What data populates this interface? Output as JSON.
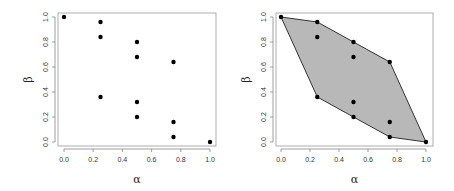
{
  "chart_data": [
    {
      "type": "scatter",
      "title": "",
      "xlabel": "α",
      "ylabel": "β",
      "xlim": [
        0,
        1
      ],
      "ylim": [
        0,
        1
      ],
      "xticks": [
        "0.0",
        "0.2",
        "0.4",
        "0.6",
        "0.8",
        "1.0"
      ],
      "yticks": [
        "0.0",
        "0.2",
        "0.4",
        "0.6",
        "0.8",
        "1.0"
      ],
      "grid": false,
      "legend": null,
      "points": [
        {
          "x": 0.0,
          "y": 1.0
        },
        {
          "x": 0.25,
          "y": 0.96
        },
        {
          "x": 0.25,
          "y": 0.84
        },
        {
          "x": 0.25,
          "y": 0.36
        },
        {
          "x": 0.5,
          "y": 0.8
        },
        {
          "x": 0.5,
          "y": 0.68
        },
        {
          "x": 0.5,
          "y": 0.32
        },
        {
          "x": 0.5,
          "y": 0.2
        },
        {
          "x": 0.75,
          "y": 0.64
        },
        {
          "x": 0.75,
          "y": 0.16
        },
        {
          "x": 0.75,
          "y": 0.04
        },
        {
          "x": 1.0,
          "y": 0.0
        }
      ]
    },
    {
      "type": "scatter",
      "title": "",
      "xlabel": "α",
      "ylabel": "β",
      "xlim": [
        0,
        1
      ],
      "ylim": [
        0,
        1
      ],
      "xticks": [
        "0.0",
        "0.2",
        "0.4",
        "0.6",
        "0.8",
        "1.0"
      ],
      "yticks": [
        "0.0",
        "0.2",
        "0.4",
        "0.6",
        "0.8",
        "1.0"
      ],
      "grid": false,
      "legend": null,
      "annotation": "convex hull shaded gray",
      "hull_fill": "#b8b8b8",
      "hull": [
        {
          "x": 0.0,
          "y": 1.0
        },
        {
          "x": 0.25,
          "y": 0.96
        },
        {
          "x": 0.5,
          "y": 0.8
        },
        {
          "x": 0.75,
          "y": 0.64
        },
        {
          "x": 1.0,
          "y": 0.0
        },
        {
          "x": 0.75,
          "y": 0.04
        },
        {
          "x": 0.5,
          "y": 0.2
        },
        {
          "x": 0.25,
          "y": 0.36
        }
      ],
      "points": [
        {
          "x": 0.0,
          "y": 1.0
        },
        {
          "x": 0.25,
          "y": 0.96
        },
        {
          "x": 0.25,
          "y": 0.84
        },
        {
          "x": 0.25,
          "y": 0.36
        },
        {
          "x": 0.5,
          "y": 0.8
        },
        {
          "x": 0.5,
          "y": 0.68
        },
        {
          "x": 0.5,
          "y": 0.32
        },
        {
          "x": 0.5,
          "y": 0.2
        },
        {
          "x": 0.75,
          "y": 0.64
        },
        {
          "x": 0.75,
          "y": 0.16
        },
        {
          "x": 0.75,
          "y": 0.04
        },
        {
          "x": 1.0,
          "y": 0.0
        }
      ]
    }
  ]
}
